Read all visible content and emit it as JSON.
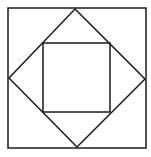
{
  "diagram": {
    "title": "",
    "stroke_color": "#1a1a1a",
    "background": "#ffffff",
    "outer_square": {
      "x1": 8,
      "y1": 8,
      "x2": 146,
      "y2": 148
    },
    "diamond": {
      "top": [
        75,
        9
      ],
      "right": [
        145,
        79
      ],
      "bottom": [
        77,
        147
      ],
      "left": [
        9,
        78
      ]
    },
    "inner_square": {
      "x1": 43,
      "y1": 43,
      "x2": 110,
      "y2": 112
    }
  }
}
